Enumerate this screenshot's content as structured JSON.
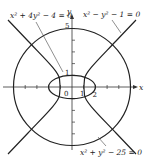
{
  "diagram": {
    "curves": [
      {
        "name": "circle",
        "equation": "x² + y² − 25 = 0"
      },
      {
        "name": "ellipse",
        "equation": "x² + 4y² − 4 = 0"
      },
      {
        "name": "hyperbola",
        "equation": "x² − y² − 1 = 0"
      }
    ],
    "labels": {
      "ellipse_eq": "x² + 4y² − 4 = 0",
      "hyperbola_eq": "x² − y² − 1 = 0",
      "circle_eq": "x² + y² − 25 = 0",
      "x_axis": "x",
      "y_axis": "y",
      "origin": "0",
      "tick_y5": "5",
      "tick_y1": "1",
      "tick_x1": "1",
      "tick_x2": "2"
    },
    "stroke_color": "#222222"
  }
}
